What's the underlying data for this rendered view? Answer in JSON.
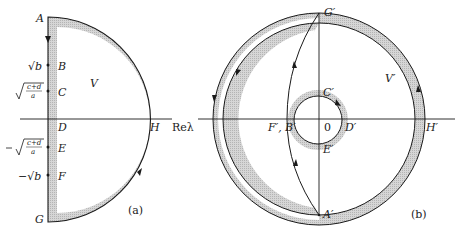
{
  "panel_a": {
    "caption": "(a)",
    "axis_label": "Reλ",
    "region_label": "V",
    "points": {
      "A": "A",
      "B": "B",
      "C": "C",
      "D": "D",
      "E": "E",
      "F": "F",
      "G": "G",
      "H": "H"
    },
    "tick_labels": {
      "sqrt_b": "√b",
      "sqrt_cd_a": "√(c+d)/a",
      "neg_sqrt_cd_a": "−√(c+d)/a",
      "neg_sqrt_b": "−√b"
    },
    "frac_num": "c+d",
    "frac_den": "a"
  },
  "panel_b": {
    "caption": "(b)",
    "region_label": "V′",
    "origin": "0",
    "points": {
      "G": "G′",
      "C": "C′",
      "D": "D′",
      "E": "E′",
      "FB": "F′, B′",
      "H": "H′",
      "A": "A′"
    }
  },
  "colors": {
    "line": "#1a1a1a",
    "shade": "#c8c8c8"
  }
}
